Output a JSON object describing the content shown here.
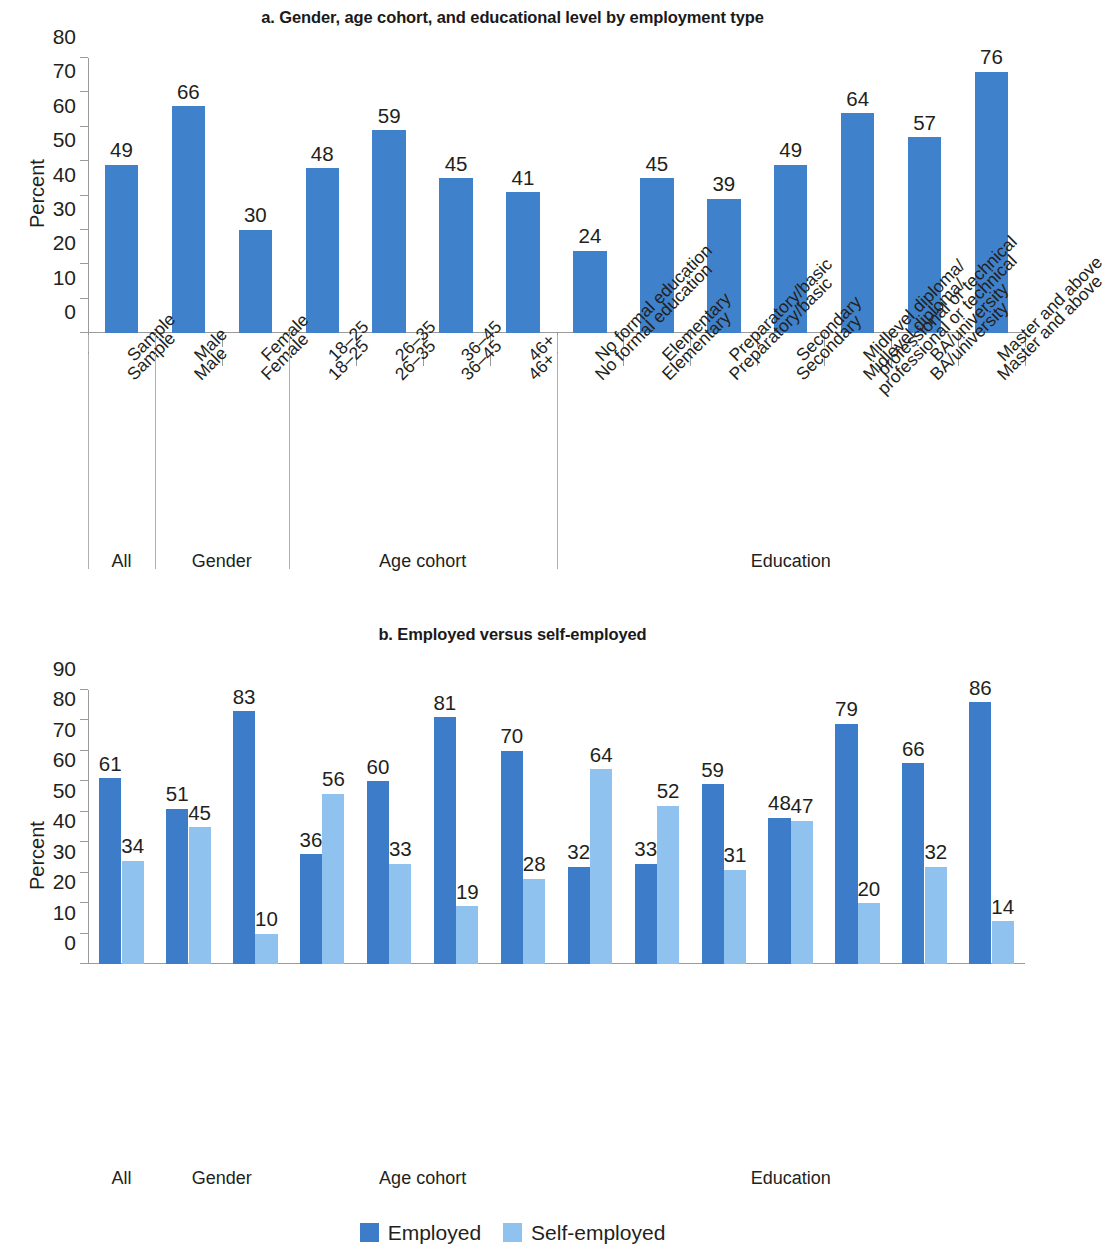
{
  "colors": {
    "employed": "#3d7cc9",
    "self_employed": "#8fc2ee",
    "single_series": "#3f82cb",
    "axis": "#9a9a9a",
    "text": "#231f20"
  },
  "legend": {
    "items": [
      {
        "label": "Employed",
        "color": "#3d7cc9",
        "swatch": "dark"
      },
      {
        "label": "Self-employed",
        "color": "#8fc2ee",
        "swatch": "light"
      }
    ]
  },
  "chart_data": [
    {
      "id": "panel-a",
      "type": "bar",
      "title": "a. Gender, age cohort, and educational level by employment type",
      "xlabel": "",
      "ylabel": "Percent",
      "ylim": [
        0,
        80
      ],
      "yticks": [
        0,
        10,
        20,
        30,
        40,
        50,
        60,
        70,
        80
      ],
      "grid": false,
      "legend_position": "none",
      "categories": [
        "Sample",
        "Male",
        "Female",
        "18–25",
        "26–35",
        "36–45",
        "46+",
        "No formal education",
        "Elementary",
        "Preparatory/basic",
        "Secondary",
        "Midlevel diploma/\nprofessional or technical",
        "BA/university",
        "Master and above"
      ],
      "values": [
        49,
        66,
        30,
        48,
        59,
        45,
        41,
        24,
        45,
        39,
        49,
        64,
        57,
        76
      ],
      "groups": [
        {
          "label": "All",
          "start": 0,
          "end": 0
        },
        {
          "label": "Gender",
          "start": 1,
          "end": 2
        },
        {
          "label": "Age cohort",
          "start": 3,
          "end": 6
        },
        {
          "label": "Education",
          "start": 7,
          "end": 13
        }
      ]
    },
    {
      "id": "panel-b",
      "type": "bar",
      "title": "b. Employed versus self-employed",
      "xlabel": "",
      "ylabel": "Percent",
      "ylim": [
        0,
        90
      ],
      "yticks": [
        0,
        10,
        20,
        30,
        40,
        50,
        60,
        70,
        80,
        90
      ],
      "grid": false,
      "legend_position": "bottom",
      "categories": [
        "Sample",
        "Male",
        "Female",
        "18–25",
        "26–35",
        "36–45",
        "46+",
        "No formal education",
        "Elementary",
        "Preparatory/basic",
        "Secondary",
        "Midlevel diploma/\nprofessional or technical",
        "BA/university",
        "Master and above"
      ],
      "series": [
        {
          "name": "Employed",
          "color": "#3d7cc9",
          "values": [
            61,
            51,
            83,
            36,
            60,
            81,
            70,
            32,
            33,
            59,
            48,
            79,
            66,
            86
          ]
        },
        {
          "name": "Self-employed",
          "color": "#8fc2ee",
          "values": [
            34,
            45,
            10,
            56,
            33,
            19,
            28,
            64,
            52,
            31,
            47,
            20,
            32,
            14
          ]
        }
      ],
      "groups": [
        {
          "label": "All",
          "start": 0,
          "end": 0
        },
        {
          "label": "Gender",
          "start": 1,
          "end": 2
        },
        {
          "label": "Age cohort",
          "start": 3,
          "end": 6
        },
        {
          "label": "Education",
          "start": 7,
          "end": 13
        }
      ]
    }
  ]
}
